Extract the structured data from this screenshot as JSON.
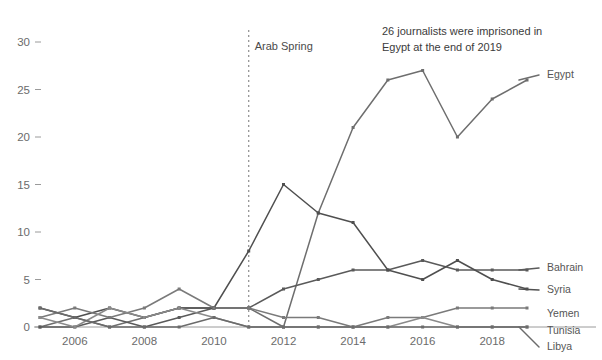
{
  "chart_data": {
    "type": "line",
    "title": "",
    "annotation": "26 journalists were imprisoned in Egypt at the end of 2019",
    "annotation_line1": "26 journalists were imprisoned in",
    "annotation_line2": "Egypt at the end of 2019",
    "event_marker_label": "Arab Spring",
    "event_marker_x": 2011,
    "xlabel": "",
    "ylabel": "",
    "xlim": [
      2005,
      2019
    ],
    "ylim": [
      0,
      31
    ],
    "grid": false,
    "legend_position": "right-edge-labels",
    "x": [
      2005,
      2006,
      2007,
      2008,
      2009,
      2010,
      2011,
      2012,
      2013,
      2014,
      2015,
      2016,
      2017,
      2018,
      2019
    ],
    "xticks": [
      2006,
      2008,
      2010,
      2012,
      2014,
      2016,
      2018
    ],
    "xtick_labels": [
      "2006",
      "2008",
      "2010",
      "2012",
      "2014",
      "2016",
      "2018"
    ],
    "yticks": [
      0,
      5,
      10,
      15,
      20,
      25,
      30
    ],
    "ytick_labels": [
      "0",
      "5",
      "10",
      "15",
      "20",
      "25",
      "30"
    ],
    "series": [
      {
        "name": "Egypt",
        "color": "#6e6e6e",
        "values": [
          0,
          1,
          0,
          1,
          2,
          2,
          2,
          0,
          12,
          21,
          26,
          27,
          20,
          24,
          26
        ]
      },
      {
        "name": "Bahrain",
        "color": "#5a5a5a",
        "values": [
          0,
          0,
          1,
          0,
          1,
          2,
          2,
          4,
          5,
          6,
          6,
          7,
          6,
          6,
          6
        ]
      },
      {
        "name": "Syria",
        "color": "#4f4f4f",
        "values": [
          2,
          1,
          2,
          1,
          2,
          2,
          8,
          15,
          12,
          11,
          6,
          5,
          7,
          5,
          4
        ]
      },
      {
        "name": "Yemen",
        "color": "#7a7a7a",
        "values": [
          1,
          2,
          1,
          2,
          4,
          2,
          2,
          1,
          1,
          0,
          1,
          1,
          2,
          2,
          2
        ]
      },
      {
        "name": "Tunisia",
        "color": "#8a8a8a",
        "values": [
          1,
          0,
          2,
          1,
          2,
          1,
          0,
          0,
          0,
          0,
          0,
          1,
          0,
          0,
          0
        ]
      },
      {
        "name": "Libya",
        "color": "#6b6b6b",
        "values": [
          2,
          1,
          0,
          0,
          0,
          1,
          0,
          0,
          0,
          0,
          0,
          0,
          0,
          0,
          0
        ]
      }
    ],
    "series_label_positions": [
      {
        "name": "Egypt",
        "y_value": 26
      },
      {
        "name": "Bahrain",
        "y_value": 6
      },
      {
        "name": "Syria",
        "y_value": 4
      },
      {
        "name": "Yemen",
        "y_value": 2
      },
      {
        "name": "Tunisia",
        "y_value": 1
      },
      {
        "name": "Libya",
        "y_value": 0
      }
    ]
  }
}
